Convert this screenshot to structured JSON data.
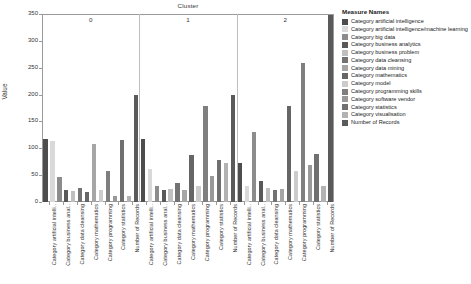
{
  "chart_data": {
    "type": "bar",
    "title": "Cluster",
    "xlabel": "",
    "ylabel": "Value",
    "ylim": [
      0,
      350
    ],
    "yticks": [
      0,
      50,
      100,
      150,
      200,
      250,
      300,
      350
    ],
    "ytick_labels": [
      "0",
      "50",
      "100",
      "150",
      "200",
      "250",
      "300",
      "350"
    ],
    "grid": false,
    "legend_position": "right",
    "legend_title": "Measure Names",
    "clusters": [
      "0",
      "1",
      "2"
    ],
    "categories": [
      "Category artificial intelli..",
      "Category business anal..",
      "Category data cleansing",
      "Category mathematics",
      "Category programming",
      "Category statistics",
      "Number of Records"
    ],
    "series": [
      {
        "name": "Category artificial intelligence",
        "color": "#4d4d4d",
        "values_by_cluster": {
          "0": 118,
          "1": 118,
          "2": 73
        }
      },
      {
        "name": "Category artificial intelligence/machine learning",
        "color": "#d9d9d9",
        "values_by_cluster": {
          "0": 113,
          "1": 62,
          "2": 29
        }
      },
      {
        "name": "Category big data",
        "color": "#8c8c8c",
        "values_by_cluster": {
          "0": 47,
          "1": 30,
          "2": 130
        }
      },
      {
        "name": "Category business analytics",
        "color": "#595959",
        "values_by_cluster": {
          "0": 22,
          "1": 23,
          "2": 40
        }
      },
      {
        "name": "Category business problem",
        "color": "#bfbfbf",
        "values_by_cluster": {
          "0": 20,
          "1": 24,
          "2": 26
        }
      },
      {
        "name": "Category data cleansing",
        "color": "#737373",
        "values_by_cluster": {
          "0": 27,
          "1": 36,
          "2": 22
        }
      },
      {
        "name": "Category data mining",
        "color": "#a6a6a6",
        "values_by_cluster": {
          "0": 108,
          "1": 23,
          "2": 25
        }
      },
      {
        "name": "Category mathematics",
        "color": "#666666",
        "values_by_cluster": {
          "0": 19,
          "1": 88,
          "2": 178
        }
      },
      {
        "name": "Category model",
        "color": "#cccccc",
        "values_by_cluster": {
          "0": 23,
          "1": 30,
          "2": 58
        }
      },
      {
        "name": "Category programming skills",
        "color": "#7f7f7f",
        "values_by_cluster": {
          "0": 57,
          "1": 178,
          "2": 258
        }
      },
      {
        "name": "Category software vendor",
        "color": "#999999",
        "values_by_cluster": {
          "0": 11,
          "1": 48,
          "2": 68
        }
      },
      {
        "name": "Category statistics",
        "color": "#707070",
        "values_by_cluster": {
          "0": 115,
          "1": 79,
          "2": 90
        }
      },
      {
        "name": "Category visualisation",
        "color": "#b3b3b3",
        "values_by_cluster": {
          "0": 11,
          "1": 72,
          "2": 29
        }
      },
      {
        "name": "Number of Records",
        "color": "#5a5a5a",
        "values_by_cluster": {
          "0": 200,
          "1": 200,
          "2": 348
        }
      }
    ],
    "bars": [
      {
        "cluster": "0",
        "label": "Category artificial intelli..",
        "value": 118,
        "color": "#4d4d4d"
      },
      {
        "cluster": "0",
        "label": "Category artificial intelli..",
        "value": 113,
        "color": "#d9d9d9"
      },
      {
        "cluster": "0",
        "label": "Category business anal..",
        "value": 47,
        "color": "#8c8c8c"
      },
      {
        "cluster": "0",
        "label": "Category business anal..",
        "value": 22,
        "color": "#595959"
      },
      {
        "cluster": "0",
        "label": "Category data cleansing",
        "value": 20,
        "color": "#bfbfbf"
      },
      {
        "cluster": "0",
        "label": "Category data cleansing",
        "value": 27,
        "color": "#737373"
      },
      {
        "cluster": "0",
        "label": "Category mathematics",
        "value": 19,
        "color": "#666666"
      },
      {
        "cluster": "0",
        "label": "Category mathematics",
        "value": 108,
        "color": "#a6a6a6"
      },
      {
        "cluster": "0",
        "label": "Category programming",
        "value": 23,
        "color": "#cccccc"
      },
      {
        "cluster": "0",
        "label": "Category programming",
        "value": 57,
        "color": "#7f7f7f"
      },
      {
        "cluster": "0",
        "label": "Category statistics",
        "value": 11,
        "color": "#999999"
      },
      {
        "cluster": "0",
        "label": "Category statistics",
        "value": 115,
        "color": "#707070"
      },
      {
        "cluster": "0",
        "label": "Number of Records",
        "value": 11,
        "color": "#b3b3b3"
      },
      {
        "cluster": "0",
        "label": "Number of Records",
        "value": 200,
        "color": "#5a5a5a"
      },
      {
        "cluster": "1",
        "label": "Category artificial intelli..",
        "value": 118,
        "color": "#4d4d4d"
      },
      {
        "cluster": "1",
        "label": "Category artificial intelli..",
        "value": 62,
        "color": "#d9d9d9"
      },
      {
        "cluster": "1",
        "label": "Category business anal..",
        "value": 30,
        "color": "#8c8c8c"
      },
      {
        "cluster": "1",
        "label": "Category business anal..",
        "value": 23,
        "color": "#595959"
      },
      {
        "cluster": "1",
        "label": "Category data cleansing",
        "value": 24,
        "color": "#bfbfbf"
      },
      {
        "cluster": "1",
        "label": "Category data cleansing",
        "value": 36,
        "color": "#737373"
      },
      {
        "cluster": "1",
        "label": "Category mathematics",
        "value": 23,
        "color": "#a6a6a6"
      },
      {
        "cluster": "1",
        "label": "Category mathematics",
        "value": 88,
        "color": "#666666"
      },
      {
        "cluster": "1",
        "label": "Category programming",
        "value": 30,
        "color": "#cccccc"
      },
      {
        "cluster": "1",
        "label": "Category programming",
        "value": 178,
        "color": "#7f7f7f"
      },
      {
        "cluster": "1",
        "label": "Category statistics",
        "value": 48,
        "color": "#999999"
      },
      {
        "cluster": "1",
        "label": "Category statistics",
        "value": 79,
        "color": "#707070"
      },
      {
        "cluster": "1",
        "label": "Number of Records",
        "value": 72,
        "color": "#b3b3b3"
      },
      {
        "cluster": "1",
        "label": "Number of Records",
        "value": 200,
        "color": "#5a5a5a"
      },
      {
        "cluster": "2",
        "label": "Category artificial intelli..",
        "value": 73,
        "color": "#4d4d4d"
      },
      {
        "cluster": "2",
        "label": "Category artificial intelli..",
        "value": 29,
        "color": "#d9d9d9"
      },
      {
        "cluster": "2",
        "label": "Category business anal..",
        "value": 130,
        "color": "#8c8c8c"
      },
      {
        "cluster": "2",
        "label": "Category business anal..",
        "value": 40,
        "color": "#595959"
      },
      {
        "cluster": "2",
        "label": "Category data cleansing",
        "value": 26,
        "color": "#bfbfbf"
      },
      {
        "cluster": "2",
        "label": "Category data cleansing",
        "value": 22,
        "color": "#737373"
      },
      {
        "cluster": "2",
        "label": "Category mathematics",
        "value": 25,
        "color": "#a6a6a6"
      },
      {
        "cluster": "2",
        "label": "Category mathematics",
        "value": 178,
        "color": "#666666"
      },
      {
        "cluster": "2",
        "label": "Category programming",
        "value": 58,
        "color": "#cccccc"
      },
      {
        "cluster": "2",
        "label": "Category programming",
        "value": 258,
        "color": "#7f7f7f"
      },
      {
        "cluster": "2",
        "label": "Category statistics",
        "value": 68,
        "color": "#999999"
      },
      {
        "cluster": "2",
        "label": "Category statistics",
        "value": 90,
        "color": "#707070"
      },
      {
        "cluster": "2",
        "label": "Number of Records",
        "value": 29,
        "color": "#b3b3b3"
      },
      {
        "cluster": "2",
        "label": "Number of Records",
        "value": 348,
        "color": "#5a5a5a"
      }
    ],
    "xtick_labels": [
      "Category artificial intelli..",
      "Category business anal..",
      "Category data cleansing",
      "Category mathematics",
      "Category programming",
      "Category statistics",
      "Number of Records",
      "Category artificial intelli..",
      "Category business anal..",
      "Category data cleansing",
      "Category mathematics",
      "Category programming",
      "Category statistics",
      "Number of Records",
      "Category artificial intelli..",
      "Category business anal..",
      "Category data cleansing",
      "Category mathematics",
      "Category programming",
      "Category statistics",
      "Number of Records"
    ]
  },
  "legend": {
    "title": "Measure Names",
    "items": [
      {
        "label": "Category artificial intelligence",
        "color": "#4d4d4d"
      },
      {
        "label": "Category artificial intelligence/machine learning",
        "color": "#d9d9d9"
      },
      {
        "label": "Category big data",
        "color": "#8c8c8c"
      },
      {
        "label": "Category business analytics",
        "color": "#595959"
      },
      {
        "label": "Category business problem",
        "color": "#bfbfbf"
      },
      {
        "label": "Category data cleansing",
        "color": "#737373"
      },
      {
        "label": "Category data mining",
        "color": "#a6a6a6"
      },
      {
        "label": "Category mathematics",
        "color": "#666666"
      },
      {
        "label": "Category model",
        "color": "#cccccc"
      },
      {
        "label": "Category programming skills",
        "color": "#7f7f7f"
      },
      {
        "label": "Category software vendor",
        "color": "#999999"
      },
      {
        "label": "Category statistics",
        "color": "#707070"
      },
      {
        "label": "Category visualisation",
        "color": "#b3b3b3"
      },
      {
        "label": "Number of Records",
        "color": "#5a5a5a"
      }
    ]
  }
}
